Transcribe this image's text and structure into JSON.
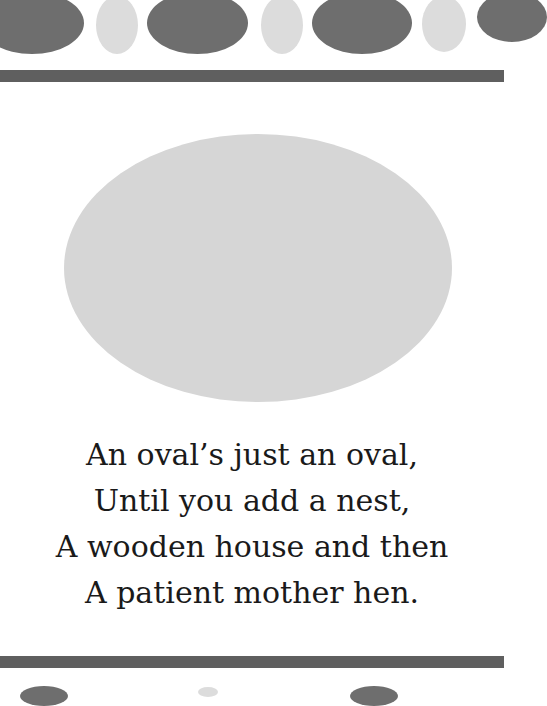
{
  "poem": {
    "lines": [
      "An oval’s just an oval,",
      "Until you add a nest,",
      "A wooden house and then",
      "A patient mother hen."
    ]
  },
  "colors": {
    "dark_oval": "#6e6e6e",
    "light_oval": "#dcdcdc",
    "border_bar": "#5f5f5f",
    "center_oval": "#d6d6d6",
    "text": "#1a1a1a"
  }
}
